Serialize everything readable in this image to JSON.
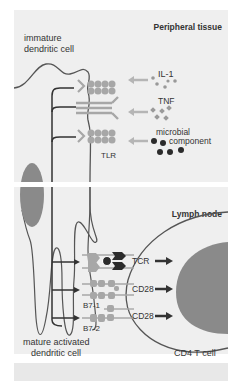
{
  "figure": {
    "panels": {
      "top": {
        "title": "Peripheral tissue"
      },
      "bottom": {
        "title": "Lymph node"
      }
    },
    "labels": {
      "immature_cell_line1": "immature",
      "immature_cell_line2": "dendritic cell",
      "mature_cell_line1": "mature activated",
      "mature_cell_line2": "dendritic cell",
      "t_cell": "CD4 T cell",
      "tlr": "TLR",
      "il1": "IL-1",
      "tnf": "TNF",
      "microbial_line1": "microbial",
      "microbial_line2": "component",
      "tcr": "TCR",
      "cd28_1": "CD28",
      "cd28_2": "CD28",
      "b7_1": "B7-1",
      "b7_2": "B7-2"
    },
    "colors": {
      "panel_bg": "#efefef",
      "outline": "#555555",
      "receptor": "#a7a7a7",
      "nucleus": "#8a8a8a",
      "dark_ligand": "#2b2b2b",
      "arrow_dark": "#333333",
      "arrow_light": "#b5b5b5"
    }
  }
}
